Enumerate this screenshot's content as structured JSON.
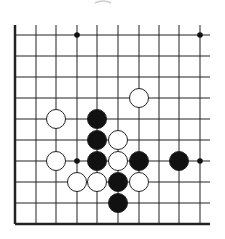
{
  "board": {
    "title": "Go problem diagram",
    "columns_x": [
      15,
      36,
      56,
      77,
      97,
      118,
      139,
      159,
      179,
      200
    ],
    "rows_y": [
      35,
      56,
      77,
      98,
      119,
      140,
      161,
      182,
      203,
      224
    ],
    "line_top": 25,
    "line_right": 210,
    "left_edge": true,
    "bottom_edge": true,
    "stone_radius": 9.5,
    "colors": {
      "line": "#222222",
      "black": "#111111",
      "white": "#ffffff",
      "stone_outline": "#222222"
    },
    "star_points": [
      [
        3,
        0
      ],
      [
        9,
        0
      ],
      [
        3,
        6
      ],
      [
        9,
        6
      ]
    ],
    "stones": [
      {
        "color": "white",
        "col": 6,
        "row": 3
      },
      {
        "color": "white",
        "col": 2,
        "row": 4
      },
      {
        "color": "black",
        "col": 4,
        "row": 4
      },
      {
        "color": "black",
        "col": 4,
        "row": 5
      },
      {
        "color": "white",
        "col": 5,
        "row": 5
      },
      {
        "color": "white",
        "col": 2,
        "row": 6
      },
      {
        "color": "black",
        "col": 4,
        "row": 6
      },
      {
        "color": "white",
        "col": 5,
        "row": 6
      },
      {
        "color": "black",
        "col": 6,
        "row": 6
      },
      {
        "color": "black",
        "col": 8,
        "row": 6
      },
      {
        "color": "white",
        "col": 3,
        "row": 7
      },
      {
        "color": "white",
        "col": 4,
        "row": 7
      },
      {
        "color": "black",
        "col": 5,
        "row": 7
      },
      {
        "color": "white",
        "col": 6,
        "row": 7
      },
      {
        "color": "black",
        "col": 5,
        "row": 8
      }
    ]
  }
}
